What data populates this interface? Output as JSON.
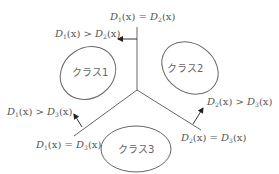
{
  "diagram": {
    "type": "decision-boundaries",
    "classes": [
      {
        "label": "クラス1"
      },
      {
        "label": "クラス2"
      },
      {
        "label": "クラス3"
      }
    ],
    "boundaries": [
      {
        "label": "D1(x) = D2(x)",
        "f1": "D",
        "s1": "1",
        "f2": "D",
        "s2": "2",
        "op": "="
      },
      {
        "label": "D1(x) = D3(x)",
        "f1": "D",
        "s1": "1",
        "f2": "D",
        "s2": "3",
        "op": "="
      },
      {
        "label": "D2(x) = D3(x)",
        "f1": "D",
        "s1": "2",
        "f2": "D",
        "s2": "3",
        "op": "="
      }
    ],
    "inequalities": [
      {
        "label": "D1(x) > D2(x)",
        "s1": "1",
        "s2": "2",
        "op": ">"
      },
      {
        "label": "D1(x) > D3(x)",
        "s1": "1",
        "s2": "3",
        "op": ">"
      },
      {
        "label": "D2(x) > D3(x)",
        "s1": "2",
        "s2": "3",
        "op": ">"
      }
    ],
    "var": "(x)",
    "stroke_color": "#555555"
  }
}
